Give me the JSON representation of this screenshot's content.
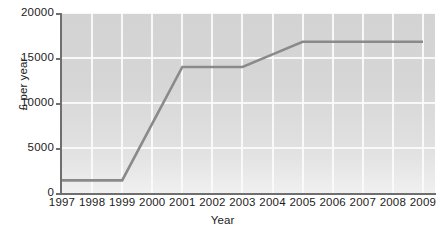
{
  "chart_data": {
    "type": "line",
    "title": "",
    "xlabel": "Year",
    "ylabel": "£ per year",
    "x": [
      1997,
      1998,
      1999,
      2000,
      2001,
      2002,
      2003,
      2004,
      2005,
      2006,
      2007,
      2008,
      2009
    ],
    "values": [
      1400,
      1400,
      1400,
      7700,
      14000,
      14000,
      14000,
      15400,
      16800,
      16800,
      16800,
      16800,
      16800
    ],
    "series": [
      {
        "name": "Tuition fee",
        "values": [
          1400,
          1400,
          1400,
          7700,
          14000,
          14000,
          14000,
          15400,
          16800,
          16800,
          16800,
          16800,
          16800
        ]
      }
    ],
    "x_tick_labels": [
      "1997",
      "1998",
      "1999",
      "2000",
      "2001",
      "2002",
      "2003",
      "2004",
      "2005",
      "2006",
      "2007",
      "2008",
      "2009"
    ],
    "y_tick_labels": [
      "0",
      "5000",
      "10000",
      "15000",
      "20000"
    ],
    "y_tick_values": [
      0,
      5000,
      10000,
      15000,
      20000
    ],
    "xlim": [
      1997,
      2009.4
    ],
    "ylim": [
      0,
      20000
    ],
    "grid": true,
    "legend": "none",
    "line_color": "#8a8a8a",
    "plot_background": "#d8d8d8",
    "grid_color": "#fbfbfb",
    "axis_color": "#6f6f6f",
    "text_color": "#1c1c1c"
  }
}
